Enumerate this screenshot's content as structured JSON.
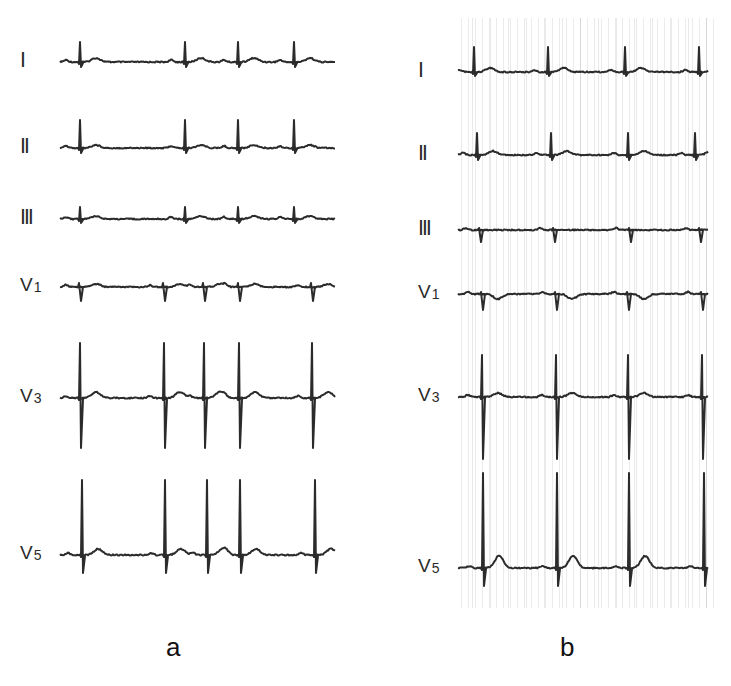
{
  "figure": {
    "panels": [
      {
        "id": "a",
        "caption": "a",
        "leads": [
          {
            "label": "Ⅰ",
            "sub": "",
            "baseline_y": 62,
            "beats_x": [
              78,
              183,
              236,
              292
            ],
            "r_amp": 20,
            "s_amp": 5,
            "t_amp": 4,
            "q_type": "small"
          },
          {
            "label": "Ⅱ",
            "sub": "",
            "baseline_y": 148,
            "beats_x": [
              78,
              183,
              236,
              292
            ],
            "r_amp": 28,
            "s_amp": 5,
            "t_amp": 3,
            "q_type": "small"
          },
          {
            "label": "Ⅲ",
            "sub": "",
            "baseline_y": 219,
            "beats_x": [
              78,
              183,
              236,
              292
            ],
            "r_amp": 12,
            "s_amp": 4,
            "t_amp": 3,
            "q_type": "small"
          },
          {
            "label": "V",
            "sub": "1",
            "baseline_y": 287,
            "beats_x": [
              78,
              162,
              202,
              237,
              310
            ],
            "r_amp": 4,
            "s_amp": 14,
            "t_amp": 3,
            "q_type": "qs"
          },
          {
            "label": "V",
            "sub": "3",
            "baseline_y": 398,
            "beats_x": [
              78,
              162,
              202,
              237,
              310
            ],
            "r_amp": 55,
            "s_amp": 50,
            "t_amp": 6,
            "q_type": "rs"
          },
          {
            "label": "V",
            "sub": "5",
            "baseline_y": 555,
            "beats_x": [
              80,
              163,
              205,
              238,
              313
            ],
            "r_amp": 75,
            "s_amp": 18,
            "t_amp": 6,
            "q_type": "rs"
          }
        ]
      },
      {
        "id": "b",
        "caption": "b",
        "leads": [
          {
            "label": "Ⅰ",
            "sub": "",
            "baseline_y": 72,
            "beats_x": [
              472,
              546,
              623,
              697
            ],
            "r_amp": 25,
            "s_amp": 4,
            "t_amp": 4,
            "q_type": "small"
          },
          {
            "label": "Ⅱ",
            "sub": "",
            "baseline_y": 155,
            "beats_x": [
              475,
              549,
              626,
              693
            ],
            "r_amp": 22,
            "s_amp": 5,
            "t_amp": 4,
            "q_type": "small"
          },
          {
            "label": "Ⅲ",
            "sub": "",
            "baseline_y": 230,
            "beats_x": [
              478,
              552,
              628,
              698
            ],
            "r_amp": 2,
            "s_amp": 12,
            "t_amp": 0,
            "q_type": "qs"
          },
          {
            "label": "V",
            "sub": "1",
            "baseline_y": 294,
            "beats_x": [
              480,
              554,
              626,
              700
            ],
            "r_amp": 2,
            "s_amp": 16,
            "t_amp": -5,
            "q_type": "qs"
          },
          {
            "label": "V",
            "sub": "3",
            "baseline_y": 397,
            "beats_x": [
              480,
              554,
              626,
              700
            ],
            "r_amp": 42,
            "s_amp": 62,
            "t_amp": 4,
            "q_type": "rs"
          },
          {
            "label": "V",
            "sub": "5",
            "baseline_y": 568,
            "beats_x": [
              481,
              555,
              627,
              702
            ],
            "r_amp": 95,
            "s_amp": 18,
            "t_amp": 12,
            "q_type": "rs"
          }
        ]
      }
    ]
  },
  "panel_a_label": "a",
  "panel_b_label": "b",
  "labels": {
    "a": [
      "Ⅰ",
      "Ⅱ",
      "Ⅲ",
      "V1",
      "V3",
      "V5"
    ],
    "b": [
      "Ⅰ",
      "Ⅱ",
      "Ⅲ",
      "V1",
      "V3",
      "V5"
    ]
  },
  "colors": {
    "trace": "#2b2b2b",
    "background": "#ffffff",
    "grid_speckle": "#7a7a7a"
  }
}
